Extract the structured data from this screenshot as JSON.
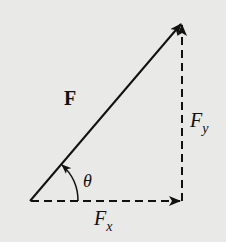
{
  "diagram": {
    "type": "vector-decomposition",
    "background_color": "#e9e9e7",
    "stroke_color": "#111111",
    "labels": {
      "vector": "F",
      "angle": "θ",
      "fy_main": "F",
      "fy_sub": "y",
      "fx_main": "F",
      "fx_sub": "x"
    },
    "elements": [
      {
        "name": "resultant-vector",
        "style": "solid",
        "from": [
          30,
          201
        ],
        "to": [
          182,
          23
        ],
        "label": "F"
      },
      {
        "name": "x-component",
        "style": "dashed",
        "from": [
          30,
          201
        ],
        "to": [
          182,
          201
        ],
        "label": "Fx"
      },
      {
        "name": "y-component",
        "style": "dashed",
        "from": [
          182,
          201
        ],
        "to": [
          182,
          23
        ],
        "label": "Fy"
      },
      {
        "name": "angle-arc",
        "style": "solid",
        "label": "θ"
      }
    ]
  }
}
